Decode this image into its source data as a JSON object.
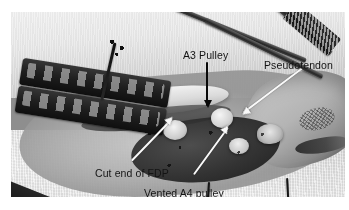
{
  "figure": {
    "type": "surgical-photograph",
    "modality": "intraoperative clinical photograph",
    "color_mode": "grayscale",
    "frame": {
      "background": "#ffffff",
      "photo_border": "none"
    }
  },
  "annotations": [
    {
      "id": "a3-pulley",
      "label": "A3 Pulley",
      "arrow_style": "black",
      "arrow_direction": "down",
      "label_position": "upper-center",
      "points_to": "A3 annular pulley over the proximal interphalangeal joint"
    },
    {
      "id": "pseudotendon",
      "label": "Pseudotendon",
      "arrow_style": "white",
      "arrow_direction": "down-left",
      "label_position": "upper-right",
      "points_to": "fibrous pseudotendon scar tissue within the sheath"
    },
    {
      "id": "cut-end-fdp",
      "label": "Cut end of FDP",
      "arrow_style": "white",
      "arrow_direction": "up-right",
      "label_position": "lower-left",
      "points_to": "severed end of the flexor digitorum profundus tendon"
    },
    {
      "id": "vented-a4-pulley",
      "label": "Vented A4 pulley",
      "arrow_style": "white",
      "arrow_direction": "up-right",
      "label_position": "lower-center",
      "points_to": "surgically vented A4 annular pulley"
    }
  ],
  "scene_elements": [
    {
      "id": "retractor",
      "name": "perforated-retractor",
      "description": "dark perforated metal retractor across the left of the field"
    },
    {
      "id": "drape-top",
      "name": "surgical-drape-upper",
      "description": "woven light surgical drape behind the hand"
    },
    {
      "id": "drape-bottom",
      "name": "surgical-drape-lower",
      "description": "woven light surgical drape in front of the hand"
    },
    {
      "id": "digit",
      "name": "patient-digit",
      "description": "patient finger at the right of the field with skin markings"
    },
    {
      "id": "instruments",
      "name": "surgical-instruments",
      "description": "instrument tips entering from the upper right"
    },
    {
      "id": "sutures",
      "name": "suture-threads",
      "description": "dark suture threads at the wound edges"
    },
    {
      "id": "tendon",
      "name": "flexor-tendon",
      "description": "pale flexor tendon running through the opened sheath"
    }
  ],
  "colors": {
    "arrow_black": "#0a0a0a",
    "arrow_white": "#f7f7f5",
    "label_text": "#111111",
    "page_background": "#ffffff"
  }
}
